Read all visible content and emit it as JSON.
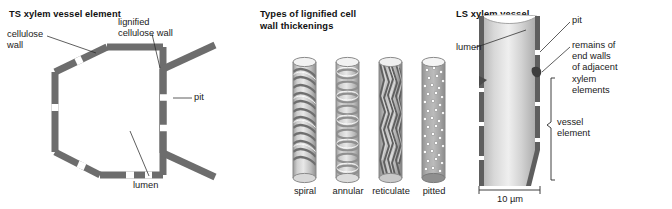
{
  "figure": {
    "background": "#ffffff",
    "wall_color": "#6d6d6d",
    "text_color": "#1a1a1a",
    "leader_color": "#2a2a2a"
  },
  "panels": {
    "ts": {
      "title": "TS xylem vessel element",
      "labels": {
        "cellulose_wall": "cellulose\nwall",
        "lignified_cellulose_wall": "lignified\ncellulose wall",
        "pit": "pit",
        "lumen": "lumen"
      }
    },
    "types": {
      "title": "Types of lignified cell\nwall thickenings",
      "cylinders": [
        {
          "name": "spiral",
          "caption": "spiral"
        },
        {
          "name": "annular",
          "caption": "annular"
        },
        {
          "name": "reticulate",
          "caption": "reticulate"
        },
        {
          "name": "pitted",
          "caption": "pitted"
        }
      ]
    },
    "ls": {
      "title": "LS xylem vessel",
      "labels": {
        "lumen": "lumen",
        "pit": "pit",
        "remains": "remains of\nend walls\nof adjacent\nxylem\nelements",
        "vessel_element": "vessel\nelement"
      },
      "scale_bar": {
        "text": "10 µm"
      }
    }
  }
}
